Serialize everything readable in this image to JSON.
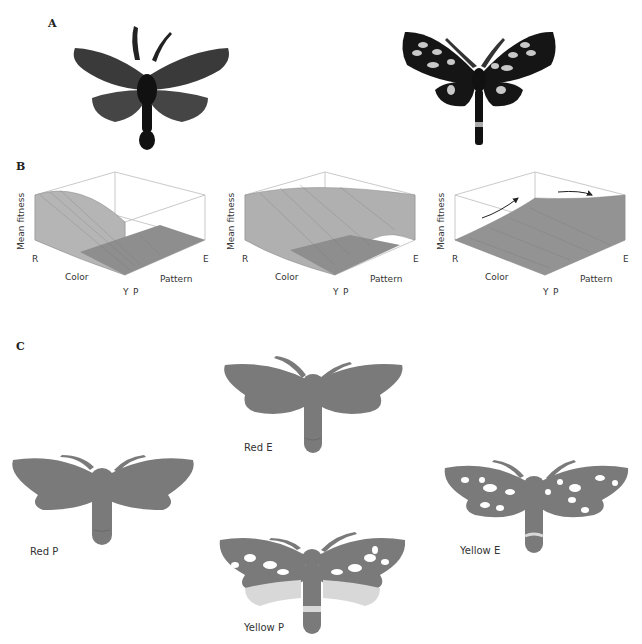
{
  "figure": {
    "panels": {
      "A": {
        "label": "A",
        "photos": [
          {
            "name": "all-black-moth",
            "description": "uniform dark moth, no spots"
          },
          {
            "name": "spotted-moth",
            "description": "dark moth with pale spots and abdominal band"
          }
        ]
      },
      "B": {
        "label": "B",
        "plots": [
          {
            "zlabel": "Mean fitness",
            "color_axis": "Color",
            "pattern_axis": "Pattern",
            "color_ticks": [
              "R",
              "Y"
            ],
            "pattern_ticks": [
              "P",
              "E"
            ],
            "shape": "peak at Red-P, flat elsewhere"
          },
          {
            "zlabel": "Mean fitness",
            "color_axis": "Color",
            "pattern_axis": "Pattern",
            "color_ticks": [
              "R",
              "Y"
            ],
            "pattern_ticks": [
              "P",
              "E"
            ],
            "shape": "saddle: high at R and at E, low at Y-P"
          },
          {
            "zlabel": "Mean fitness",
            "color_axis": "Color",
            "pattern_axis": "Pattern",
            "color_ticks": [
              "R",
              "Y"
            ],
            "pattern_ticks": [
              "P",
              "E"
            ],
            "shape": "rising toward Y-E, with arrows"
          }
        ]
      },
      "C": {
        "label": "C",
        "moths": [
          {
            "caption": "Red P"
          },
          {
            "caption": "Red E"
          },
          {
            "caption": "Yellow P"
          },
          {
            "caption": "Yellow E"
          }
        ]
      }
    }
  },
  "colors": {
    "moth_body": "#7a7a7a",
    "moth_spot": "#ffffff",
    "moth_band": "#d8d8d8",
    "photo_dark": "#1a1a1a",
    "surface": "#9a9a9a",
    "grid": "#bbbbbb"
  }
}
